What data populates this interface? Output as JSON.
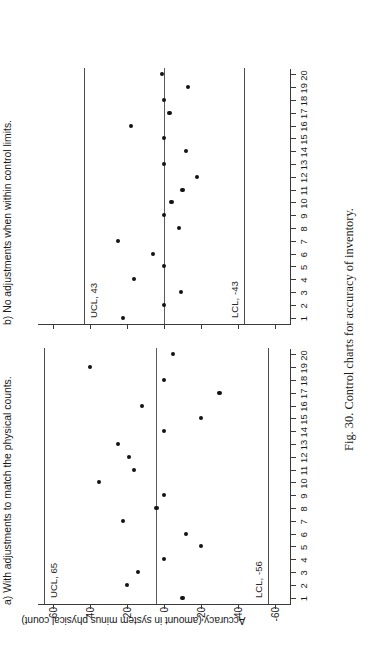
{
  "figure": {
    "caption": "Fig. 30. Control charts for accuracy of inventory.",
    "ylabel": "Accuracy (amount in system minus physical count)"
  },
  "chart_data": [
    {
      "type": "scatter",
      "title": "a) With adjustments to match the physical counts.",
      "xlabel": "",
      "ylabel": "Accuracy (amount in system minus physical count)",
      "x": [
        1,
        2,
        3,
        4,
        5,
        6,
        7,
        8,
        9,
        10,
        11,
        12,
        13,
        14,
        15,
        16,
        17,
        18,
        19,
        20
      ],
      "values": [
        -10,
        20,
        14,
        0,
        -20,
        -12,
        22,
        4,
        0,
        35,
        16,
        19,
        25,
        0,
        -20,
        12,
        -30,
        0,
        40,
        -5
      ],
      "xticklabels": [
        "1",
        "2",
        "3",
        "4",
        "5",
        "6",
        "7",
        "8",
        "9",
        "10",
        "11",
        "12",
        "13",
        "14",
        "15",
        "16",
        "17",
        "18",
        "19",
        "20"
      ],
      "yticks": [
        60,
        40,
        20,
        0,
        -20,
        -40,
        -60
      ],
      "yticklabels": [
        "60",
        "40",
        "20",
        "0",
        "-20",
        "-40",
        "-60"
      ],
      "ylim": [
        -68,
        68
      ],
      "grid": false,
      "legend": "none",
      "reference_lines": [
        {
          "name": "ucl",
          "label": "UCL, 65",
          "value": 65
        },
        {
          "name": "center",
          "label": "",
          "value": 4.5
        },
        {
          "name": "lcl",
          "label": "LCL, -56",
          "value": -56
        }
      ]
    },
    {
      "type": "scatter",
      "title": "b) No adjustments when within control limits.",
      "xlabel": "",
      "ylabel": "Accuracy (amount in system minus physical count)",
      "x": [
        1,
        2,
        3,
        4,
        5,
        6,
        7,
        8,
        9,
        10,
        11,
        12,
        13,
        14,
        15,
        16,
        17,
        18,
        19,
        20
      ],
      "values": [
        22,
        0,
        -9,
        16,
        0,
        6,
        25,
        -8,
        0,
        -4,
        -10,
        -18,
        0,
        -12,
        0,
        18,
        -3,
        0,
        -13,
        1
      ],
      "xticklabels": [
        "1",
        "2",
        "3",
        "4",
        "5",
        "6",
        "7",
        "8",
        "9",
        "10",
        "11",
        "12",
        "13",
        "14",
        "15",
        "16",
        "17",
        "18",
        "19",
        "20"
      ],
      "yticks": [
        60,
        40,
        20,
        0,
        -20,
        -40,
        -60
      ],
      "yticklabels": [
        "60",
        "40",
        "20",
        "0",
        "-20",
        "-40",
        "-60"
      ],
      "ylim": [
        -68,
        68
      ],
      "grid": false,
      "legend": "none",
      "reference_lines": [
        {
          "name": "ucl",
          "label": "UCL, 43",
          "value": 43
        },
        {
          "name": "center",
          "label": "",
          "value": 0
        },
        {
          "name": "lcl",
          "label": "LCL, -43",
          "value": -43
        }
      ]
    }
  ]
}
